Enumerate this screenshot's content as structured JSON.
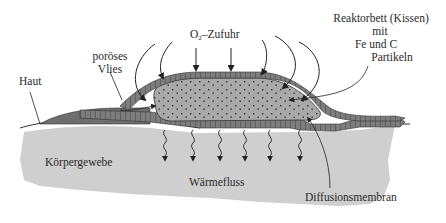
{
  "diagram": {
    "labels": {
      "o2_supply_prefix": "O",
      "o2_supply_sub": "2",
      "o2_supply_suffix": "–Zufuhr",
      "porous_fleece_line1": "poröses",
      "porous_fleece_line2": "Vlies",
      "skin": "Haut",
      "reactor_bed_line1": "Reaktorbett (Kissen)",
      "reactor_bed_line2": "mit",
      "reactor_bed_line3": "Fe  und  C",
      "reactor_bed_line4": "Partikeln",
      "body_tissue": "Körpergewebe",
      "heat_flow": "Wärmefluss",
      "diffusion_membrane": "Diffusionsmembran"
    },
    "colors": {
      "tissue": "#cfcfcf",
      "layer": "#7a7a7a",
      "layer_dark": "#5a5a5a",
      "reactor": "#a8a8a8",
      "particle": "#3a3a3a",
      "line": "#222222"
    }
  }
}
